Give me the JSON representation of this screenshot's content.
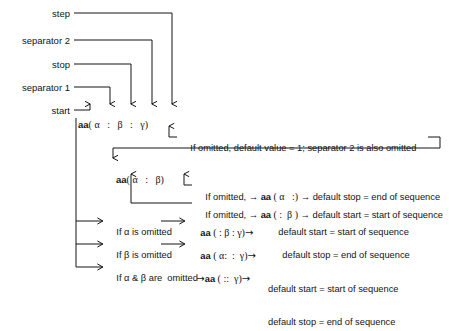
{
  "figure": {
    "ink_color": "#141414",
    "background": "#ffffff"
  },
  "callout_labels": [
    {
      "name": "step",
      "text": "step"
    },
    {
      "name": "separator-2",
      "text": "separator 2"
    },
    {
      "name": "stop",
      "text": "stop"
    },
    {
      "name": "separator-1",
      "text": "separator 1"
    },
    {
      "name": "start",
      "text": "start"
    }
  ],
  "syntax_lines": {
    "full": {
      "prefix": "aa",
      "text": "( α   :   β   :   γ)",
      "tokens": [
        "(",
        "α",
        ":",
        "β",
        ":",
        "γ",
        ")"
      ]
    },
    "two_arg": {
      "prefix": "aa",
      "text": "( α   :   β)",
      "tokens": [
        "(",
        "α",
        ":",
        "β",
        ")"
      ]
    }
  },
  "notes": {
    "step_omitted": "If omitted, default value = 1; separator 2 is also omitted",
    "stop_omitted_pre": "If omitted, → ",
    "stop_omitted_code_prefix": "aa",
    "stop_omitted_code": " ( α   :)",
    "stop_omitted_post": " → default stop = end of sequence",
    "start_omitted_pre": "If omitted, → ",
    "start_omitted_code_prefix": "aa",
    "start_omitted_code": " ( :  β )",
    "start_omitted_post": " → default start = start of sequence"
  },
  "cases": [
    {
      "name": "alpha-omitted",
      "condition": "If α is omitted",
      "code_prefix": "aa",
      "code": " ( : β : γ)",
      "result_lines": [
        "default start = start of sequence"
      ]
    },
    {
      "name": "beta-omitted",
      "condition": "If β is omitted",
      "code_prefix": "aa",
      "code": " ( α:  :  γ)",
      "result_lines": [
        "default stop = end of sequence"
      ]
    },
    {
      "name": "alpha-and-beta-omitted",
      "condition": "If α & β are  omitted",
      "code_prefix": "aa",
      "code": " ( ::  γ)",
      "result_lines": [
        "default start = start of sequence",
        "default stop = end of sequence"
      ]
    }
  ],
  "glyphs": {
    "arrow_right": "→",
    "alpha": "α",
    "beta": "β",
    "gamma": "γ"
  }
}
